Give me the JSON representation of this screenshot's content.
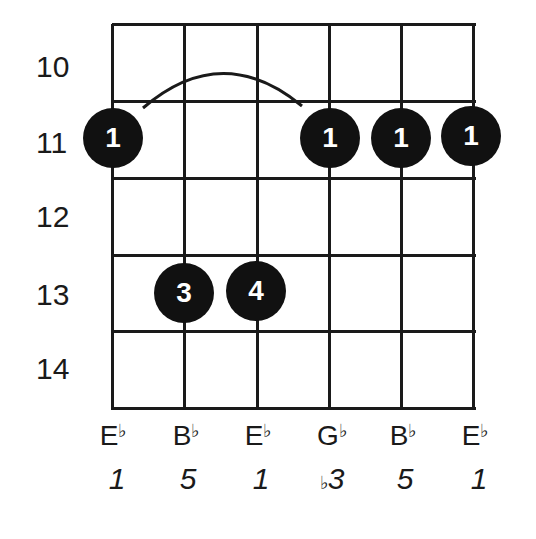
{
  "diagram": {
    "type": "guitar-chord-chart",
    "fret_numbers": [
      "10",
      "11",
      "12",
      "13",
      "14"
    ],
    "strings": [
      {
        "note": "E",
        "accidental": "♭",
        "degree": "1",
        "degree_accidental": ""
      },
      {
        "note": "B",
        "accidental": "♭",
        "degree": "5",
        "degree_accidental": ""
      },
      {
        "note": "E",
        "accidental": "♭",
        "degree": "1",
        "degree_accidental": ""
      },
      {
        "note": "G",
        "accidental": "♭",
        "degree": "3",
        "degree_accidental": "♭"
      },
      {
        "note": "B",
        "accidental": "♭",
        "degree": "5",
        "degree_accidental": ""
      },
      {
        "note": "E",
        "accidental": "♭",
        "degree": "1",
        "degree_accidental": ""
      }
    ],
    "dots": [
      {
        "string": 0,
        "fret": "11",
        "finger": "1"
      },
      {
        "string": 3,
        "fret": "11",
        "finger": "1"
      },
      {
        "string": 4,
        "fret": "11",
        "finger": "1"
      },
      {
        "string": 5,
        "fret": "11",
        "finger": "1"
      },
      {
        "string": 1,
        "fret": "13",
        "finger": "3"
      },
      {
        "string": 2,
        "fret": "13",
        "finger": "4"
      }
    ],
    "barre": {
      "from_string": 0,
      "to_string": 3,
      "fret": "11"
    }
  }
}
